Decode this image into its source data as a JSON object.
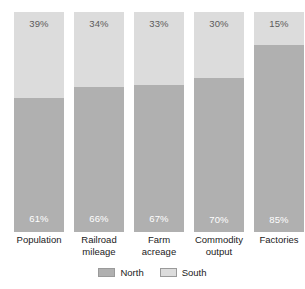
{
  "chart_data": {
    "type": "bar",
    "subtype": "stacked-percentage",
    "title": "",
    "subtitle": "",
    "xlabel": "",
    "ylabel": "",
    "ylim": [
      0,
      100
    ],
    "grid": false,
    "legend_position": "bottom-center",
    "stack_order_bottom_to_top": [
      "North",
      "South"
    ],
    "categories": [
      "Population",
      "Railroad mileage",
      "Farm acreage",
      "Commodity output",
      "Factories"
    ],
    "category_label_lines": [
      [
        "Population"
      ],
      [
        "Railroad",
        "mileage"
      ],
      [
        "Farm",
        "acreage"
      ],
      [
        "Commodity",
        "output"
      ],
      [
        "Factories"
      ]
    ],
    "series": [
      {
        "name": "North",
        "color": "#b0b0b0",
        "values": [
          61,
          66,
          67,
          70,
          85
        ],
        "value_labels": [
          "61%",
          "66%",
          "67%",
          "70%",
          "85%"
        ],
        "label_color": "#ffffff"
      },
      {
        "name": "South",
        "color": "#dcdcdc",
        "values": [
          39,
          34,
          33,
          30,
          15
        ],
        "value_labels": [
          "39%",
          "34%",
          "33%",
          "30%",
          "15%"
        ],
        "label_color": "#5b5b5b"
      }
    ]
  },
  "bars": [
    {
      "category": "Population",
      "label_line1": "Population",
      "label_line2": "",
      "south_pct": 39,
      "north_pct": 61,
      "south_label": "39%",
      "north_label": "61%"
    },
    {
      "category": "Railroad mileage",
      "label_line1": "Railroad",
      "label_line2": "mileage",
      "south_pct": 34,
      "north_pct": 66,
      "south_label": "34%",
      "north_label": "66%"
    },
    {
      "category": "Farm acreage",
      "label_line1": "Farm",
      "label_line2": "acreage",
      "south_pct": 33,
      "north_pct": 67,
      "south_label": "33%",
      "north_label": "67%"
    },
    {
      "category": "Commodity output",
      "label_line1": "Commodity",
      "label_line2": "output",
      "south_pct": 30,
      "north_pct": 70,
      "south_label": "30%",
      "north_label": "70%"
    },
    {
      "category": "Factories",
      "label_line1": "Factories",
      "label_line2": "",
      "south_pct": 15,
      "north_pct": 85,
      "south_label": "15%",
      "north_label": "85%"
    }
  ],
  "legend": {
    "items": [
      {
        "label": "North",
        "color": "#b0b0b0"
      },
      {
        "label": "South",
        "color": "#dcdcdc"
      }
    ]
  },
  "colors": {
    "north": "#b0b0b0",
    "south": "#dcdcdc",
    "background": "#ffffff",
    "text": "#1a1a1a",
    "label_on_light": "#5b5b5b",
    "label_on_dark": "#ffffff"
  }
}
